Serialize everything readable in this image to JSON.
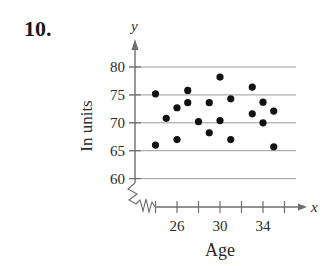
{
  "figure": {
    "problem_number": "10."
  },
  "chart_data": {
    "type": "scatter",
    "title": "",
    "xlabel": "Age",
    "ylabel": "In units",
    "x_axis_letter": "x",
    "y_axis_letter": "y",
    "xlim": [
      23,
      37
    ],
    "ylim": [
      60,
      80
    ],
    "x_ticks": [
      24,
      26,
      28,
      30,
      32,
      34,
      36
    ],
    "x_tick_labels": [
      "26",
      "30",
      "34"
    ],
    "x_tick_label_values": [
      26,
      30,
      34
    ],
    "y_ticks": [
      60,
      65,
      70,
      75,
      80
    ],
    "y_tick_labels": [
      "60",
      "65",
      "70",
      "75",
      "80"
    ],
    "grid": "horizontal",
    "axis_breaks": [
      "x",
      "y"
    ],
    "points": [
      {
        "x": 24,
        "y": 75.2
      },
      {
        "x": 24,
        "y": 66.0
      },
      {
        "x": 25,
        "y": 70.8
      },
      {
        "x": 26,
        "y": 72.7
      },
      {
        "x": 26,
        "y": 67.0
      },
      {
        "x": 27,
        "y": 75.8
      },
      {
        "x": 27,
        "y": 73.6
      },
      {
        "x": 28,
        "y": 70.2
      },
      {
        "x": 29,
        "y": 73.6
      },
      {
        "x": 29,
        "y": 68.2
      },
      {
        "x": 30,
        "y": 78.2
      },
      {
        "x": 30,
        "y": 70.4
      },
      {
        "x": 31,
        "y": 74.3
      },
      {
        "x": 31,
        "y": 67.0
      },
      {
        "x": 33,
        "y": 76.4
      },
      {
        "x": 33,
        "y": 71.6
      },
      {
        "x": 34,
        "y": 73.7
      },
      {
        "x": 34,
        "y": 70.0
      },
      {
        "x": 35,
        "y": 72.1
      },
      {
        "x": 35,
        "y": 65.7
      }
    ],
    "colors": {
      "points": "#111111",
      "axis": "#6e6e6e",
      "grid": "#9a9a9a"
    }
  }
}
